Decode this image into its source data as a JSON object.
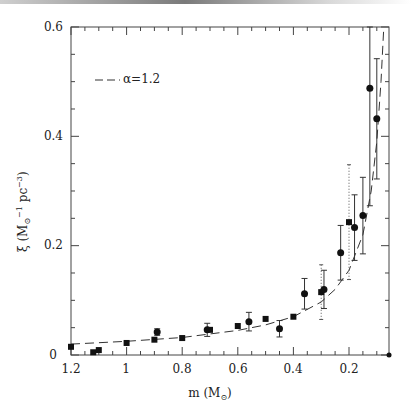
{
  "chart_data": {
    "type": "scatter",
    "title": "",
    "xlabel": "m (M⊙)",
    "ylabel": "ξ (M⊙⁻¹ pc⁻³)",
    "xlim": [
      1.2,
      0.056
    ],
    "ylim": [
      0,
      0.6
    ],
    "x_reversed": true,
    "grid": false,
    "x_ticks": [
      "1.2",
      "1",
      "0.8",
      "0.6",
      "0.4",
      "0.2"
    ],
    "y_ticks": [
      "0",
      "0.2",
      "0.4",
      "0.6"
    ],
    "legend": {
      "position": "upper-left",
      "entries": [
        {
          "label": "α=1.2",
          "style": "dashed"
        }
      ]
    },
    "series": [
      {
        "name": "circles",
        "marker": "circle",
        "points": [
          {
            "m": 0.89,
            "xi": 0.042,
            "err": 0.006
          },
          {
            "m": 0.71,
            "xi": 0.046,
            "err": 0.012
          },
          {
            "m": 0.56,
            "xi": 0.061,
            "err": 0.017
          },
          {
            "m": 0.45,
            "xi": 0.048,
            "err": 0.015
          },
          {
            "m": 0.36,
            "xi": 0.112,
            "err": 0.028
          },
          {
            "m": 0.29,
            "xi": 0.12,
            "err": 0.035
          },
          {
            "m": 0.23,
            "xi": 0.187,
            "err": 0.05
          },
          {
            "m": 0.18,
            "xi": 0.233,
            "err": 0.06
          },
          {
            "m": 0.15,
            "xi": 0.255,
            "err": 0.07
          },
          {
            "m": 0.125,
            "xi": 0.488,
            "err": 0.215
          },
          {
            "m": 0.1,
            "xi": 0.432,
            "err": 0.11
          },
          {
            "m": 0.056,
            "xi": 0.0,
            "err": 0
          }
        ]
      },
      {
        "name": "squares",
        "marker": "square",
        "points": [
          {
            "m": 1.2,
            "xi": 0.015
          },
          {
            "m": 1.12,
            "xi": 0.005
          },
          {
            "m": 1.1,
            "xi": 0.009
          },
          {
            "m": 1.0,
            "xi": 0.022
          },
          {
            "m": 0.9,
            "xi": 0.028
          },
          {
            "m": 0.8,
            "xi": 0.031
          },
          {
            "m": 0.7,
            "xi": 0.046
          },
          {
            "m": 0.6,
            "xi": 0.053
          },
          {
            "m": 0.5,
            "xi": 0.066
          },
          {
            "m": 0.4,
            "xi": 0.07
          },
          {
            "m": 0.3,
            "xi": 0.115,
            "dotted_err": 0.05
          },
          {
            "m": 0.2,
            "xi": 0.243,
            "dotted_err": 0.105
          }
        ]
      },
      {
        "name": "α=1.2 power law",
        "style": "dashed",
        "points": [
          {
            "m": 1.2,
            "xi": 0.02
          },
          {
            "m": 1.0,
            "xi": 0.025
          },
          {
            "m": 0.8,
            "xi": 0.032
          },
          {
            "m": 0.6,
            "xi": 0.045
          },
          {
            "m": 0.5,
            "xi": 0.055
          },
          {
            "m": 0.4,
            "xi": 0.07
          },
          {
            "m": 0.3,
            "xi": 0.097
          },
          {
            "m": 0.25,
            "xi": 0.12
          },
          {
            "m": 0.2,
            "xi": 0.155
          },
          {
            "m": 0.15,
            "xi": 0.22
          },
          {
            "m": 0.12,
            "xi": 0.3
          },
          {
            "m": 0.1,
            "xi": 0.39
          },
          {
            "m": 0.085,
            "xi": 0.5
          },
          {
            "m": 0.075,
            "xi": 0.6
          }
        ]
      }
    ]
  },
  "labels": {
    "x_title": "m (M",
    "x_title_sub": "⊙",
    "x_title_end": ")",
    "y_title": "ξ (M",
    "y_title_sub": "⊙",
    "y_title_sup": "−1",
    "y_title_mid": " pc",
    "y_title_sup2": "−3",
    "y_title_end": ")",
    "legend": "α=1.2",
    "xt0": "1.2",
    "xt1": "1",
    "xt2": "0.8",
    "xt3": "0.6",
    "xt4": "0.4",
    "xt5": "0.2",
    "yt0": "0",
    "yt1": "0.2",
    "yt2": "0.4",
    "yt3": "0.6"
  }
}
